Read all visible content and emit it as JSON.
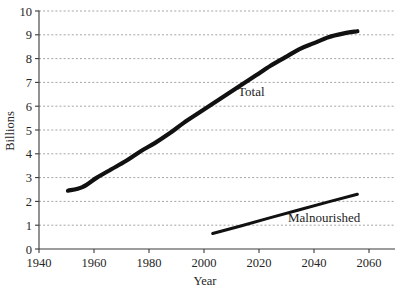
{
  "chart_data": {
    "type": "line",
    "title": "",
    "subtitle": "",
    "xlabel": "Year",
    "ylabel": "Billions",
    "xlim": [
      1940,
      2063
    ],
    "ylim": [
      0,
      10
    ],
    "x_ticks": [
      1940,
      1960,
      1980,
      2000,
      2020,
      2040,
      2060
    ],
    "x_tick_labels": [
      "1940",
      "1960",
      "1980",
      "2000",
      "2020",
      "2040",
      "2060"
    ],
    "y_ticks": [
      0,
      1,
      2,
      3,
      4,
      5,
      6,
      7,
      8,
      9,
      10
    ],
    "y_tick_labels": [
      "0",
      "1",
      "2",
      "3",
      "4",
      "5",
      "6",
      "7",
      "8",
      "9",
      "10"
    ],
    "grid": "horizontal-dotted",
    "legend": "inline-annotations",
    "series": [
      {
        "name": "Total",
        "label": "Total",
        "color": "#111111",
        "line_width": 4.2,
        "x": [
          1950,
          1955,
          1960,
          1965,
          1970,
          1975,
          1980,
          1985,
          1990,
          1995,
          2000,
          2005,
          2010,
          2015,
          2020,
          2025,
          2030,
          2035,
          2040,
          2045,
          2050
        ],
        "values": [
          2.45,
          2.6,
          3.0,
          3.35,
          3.7,
          4.1,
          4.45,
          4.85,
          5.3,
          5.7,
          6.1,
          6.5,
          6.9,
          7.3,
          7.7,
          8.05,
          8.4,
          8.65,
          8.9,
          9.05,
          9.15
        ]
      },
      {
        "name": "Malnourished",
        "label": "Malnourished",
        "color": "#111111",
        "line_width": 3.0,
        "x": [
          2000,
          2010,
          2020,
          2030,
          2040,
          2050
        ],
        "values": [
          0.65,
          0.98,
          1.32,
          1.65,
          1.98,
          2.3
        ]
      }
    ],
    "annotations": [
      {
        "text": "Total",
        "x": 2015,
        "y": 6.5
      },
      {
        "text": "Malnourished",
        "x": 2037,
        "y": 1.42
      }
    ]
  },
  "axes": {
    "y_axis_title": "Billions",
    "x_axis_title": "Year"
  }
}
